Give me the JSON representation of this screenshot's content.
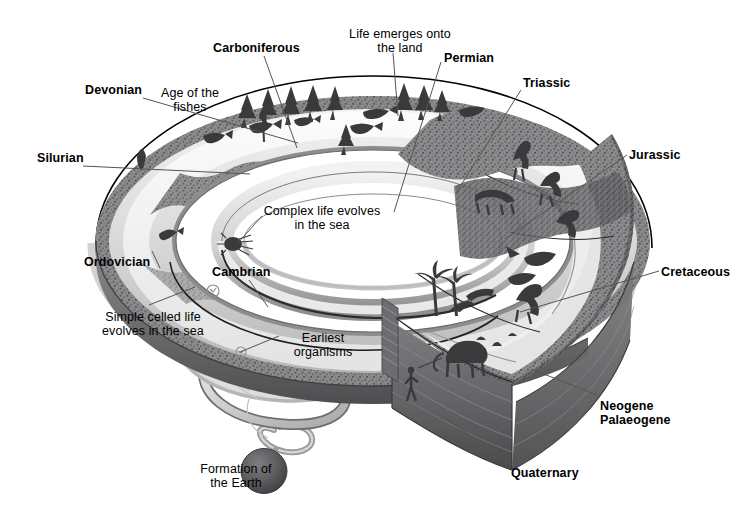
{
  "diagram": {
    "colors": {
      "background": "#ffffff",
      "outline": "#000000",
      "band_light": "#e9e9e9",
      "band_mid": "#b8b8b8",
      "band_dark": "#6f6f6f",
      "rock_dark": "#58585a",
      "sea_light": "#efefef",
      "earth_sphere": "#5a5a5c",
      "leader_line": "#555555"
    },
    "period_labels": [
      {
        "id": "carboniferous",
        "text": "Carboniferous",
        "bold": true,
        "x": 213,
        "y": 42,
        "align": "left"
      },
      {
        "id": "devonian",
        "text": "Devonian",
        "bold": true,
        "x": 85,
        "y": 84,
        "align": "left"
      },
      {
        "id": "silurian",
        "text": "Silurian",
        "bold": true,
        "x": 37,
        "y": 152,
        "align": "left"
      },
      {
        "id": "ordovician",
        "text": "Ordovician",
        "bold": true,
        "x": 84,
        "y": 256,
        "align": "left"
      },
      {
        "id": "cambrian",
        "text": "Cambrian",
        "bold": true,
        "x": 212,
        "y": 266,
        "align": "left"
      },
      {
        "id": "permian",
        "text": "Permian",
        "bold": true,
        "x": 444,
        "y": 52,
        "align": "left"
      },
      {
        "id": "triassic",
        "text": "Triassic",
        "bold": true,
        "x": 523,
        "y": 77,
        "align": "left"
      },
      {
        "id": "jurassic",
        "text": "Jurassic",
        "bold": true,
        "x": 629,
        "y": 149,
        "align": "left"
      },
      {
        "id": "cretaceous",
        "text": "Cretaceous",
        "bold": true,
        "x": 661,
        "y": 266,
        "align": "left"
      },
      {
        "id": "quaternary",
        "text": "Quaternary",
        "bold": true,
        "x": 511,
        "y": 467,
        "align": "left"
      }
    ],
    "period_labels_multiline": [
      {
        "id": "neogene-palaeogene",
        "lines": [
          "Neogene",
          "Palaeogene"
        ],
        "bold": true,
        "x": 600,
        "y": 400,
        "align": "left"
      }
    ],
    "event_labels": [
      {
        "id": "life-emerges-onto-the-land",
        "lines": [
          "Life emerges onto",
          "the land"
        ],
        "bold": false,
        "x": 332,
        "y": 28,
        "align": "center",
        "width": 136
      },
      {
        "id": "age-of-the-fishes",
        "lines": [
          "Age of the",
          "fishes"
        ],
        "bold": false,
        "x": 148,
        "y": 87,
        "align": "center",
        "width": 84
      },
      {
        "id": "complex-life-evolves-in-the-sea",
        "lines": [
          "Complex life evolves",
          "in the sea"
        ],
        "bold": false,
        "x": 251,
        "y": 205,
        "align": "center",
        "width": 142
      },
      {
        "id": "simple-celled-life-evolves-in-the-sea",
        "lines": [
          "Simple celled life",
          "evolves in the sea"
        ],
        "bold": false,
        "x": 88,
        "y": 311,
        "align": "center",
        "width": 130
      },
      {
        "id": "earliest-organisms",
        "lines": [
          "Earliest",
          "organisms"
        ],
        "bold": false,
        "x": 283,
        "y": 332,
        "align": "center",
        "width": 80
      },
      {
        "id": "formation-of-the-earth",
        "lines": [
          "Formation of",
          "the Earth"
        ],
        "bold": false,
        "x": 190,
        "y": 463,
        "align": "center",
        "width": 92
      }
    ],
    "leader_lines": [
      {
        "id": "leader-carboniferous",
        "x1": 264,
        "y1": 56,
        "x2": 297,
        "y2": 148
      },
      {
        "id": "leader-devonian",
        "x1": 143,
        "y1": 98,
        "x2": 298,
        "y2": 143
      },
      {
        "id": "leader-silurian",
        "x1": 83,
        "y1": 166,
        "x2": 250,
        "y2": 174
      },
      {
        "id": "leader-ordovician",
        "x1": 152,
        "y1": 251,
        "x2": 160,
        "y2": 268
      },
      {
        "id": "leader-cambrian",
        "x1": 249,
        "y1": 280,
        "x2": 268,
        "y2": 307
      },
      {
        "id": "leader-permian",
        "x1": 441,
        "y1": 62,
        "x2": 394,
        "y2": 212
      },
      {
        "id": "leader-triassic",
        "x1": 521,
        "y1": 90,
        "x2": 456,
        "y2": 193
      },
      {
        "id": "leader-jurassic",
        "x1": 627,
        "y1": 155,
        "x2": 505,
        "y2": 239
      },
      {
        "id": "leader-cretaceous",
        "x1": 659,
        "y1": 271,
        "x2": 520,
        "y2": 312
      },
      {
        "id": "leader-neogene",
        "x1": 597,
        "y1": 395,
        "x2": 531,
        "y2": 369
      },
      {
        "id": "leader-quaternary",
        "x1": 507,
        "y1": 462,
        "x2": 443,
        "y2": 416
      },
      {
        "id": "leader-life-emerges",
        "x1": 393,
        "y1": 53,
        "x2": 398,
        "y2": 116
      },
      {
        "id": "leader-complex-life",
        "x1": 262,
        "y1": 216,
        "x2": 237,
        "y2": 244
      },
      {
        "id": "leader-simple-celled",
        "x1": 149,
        "y1": 305,
        "x2": 195,
        "y2": 287
      },
      {
        "id": "leader-earliest-org",
        "x1": 279,
        "y1": 336,
        "x2": 240,
        "y2": 352
      }
    ],
    "legend_note": ""
  }
}
